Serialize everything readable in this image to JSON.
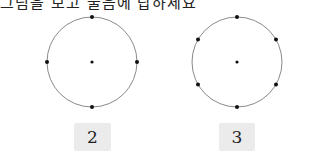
{
  "header": {
    "clipped_text": "그림을 보고 물음에 답하세요"
  },
  "figures": [
    {
      "label": "2",
      "circle": {
        "cx": 92,
        "cy": 62,
        "r": 45
      },
      "points": [
        [
          92,
          62
        ],
        [
          92,
          17
        ],
        [
          47,
          62
        ],
        [
          137,
          62
        ],
        [
          92,
          107
        ]
      ]
    },
    {
      "label": "3",
      "circle": {
        "cx": 237,
        "cy": 62,
        "r": 45
      },
      "points": [
        [
          237,
          62
        ],
        [
          237,
          17
        ],
        [
          198,
          39.5
        ],
        [
          276,
          39.5
        ],
        [
          198,
          84.5
        ],
        [
          276,
          84.5
        ],
        [
          237,
          107
        ]
      ]
    }
  ],
  "colors": {
    "circle_stroke": "#8a8a8a",
    "point": "#111111",
    "label_bg": "#ebebeb"
  }
}
